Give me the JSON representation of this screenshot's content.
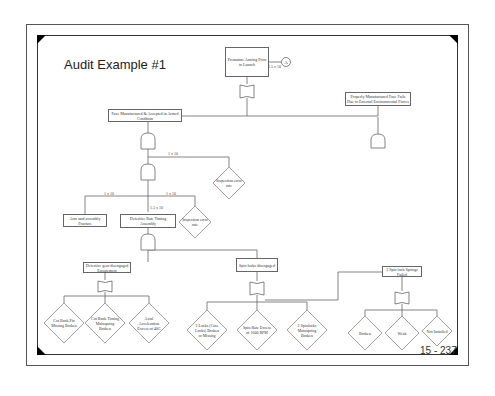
{
  "slide": {
    "title": "Audit Example #1",
    "page_number": "15 - 237"
  },
  "fault_tree": {
    "top_event": {
      "label": "Premature Arming Prior to Launch",
      "probability": "1.5 x 10",
      "transfer": "A"
    },
    "level1": [
      {
        "label": "Fuze Manufactured & Accepted in Armed Condition"
      },
      {
        "label": "Properly Manufactured Fuze Fails Due to External Environmental Forces"
      }
    ],
    "inspection_diamond_1": {
      "label": "Inspection error rate",
      "probability": "1 x 10"
    },
    "level2": [
      {
        "label": "Arm stud assembly Fracture",
        "probability": "1 x 10"
      },
      {
        "label": "Defective Rate Timing Assembly",
        "probability": "1.5 x 10"
      },
      {
        "label": "Inspection error rate",
        "probability": "1 x 10"
      }
    ],
    "level3": [
      {
        "label": "Defective gear disengaged Escapement"
      },
      {
        "label": "Spin locks disengaged"
      },
      {
        "label": "2 Spin lock Springs Failed"
      }
    ],
    "basic_events": [
      {
        "label": "Cot Bank Pin Missing Broken"
      },
      {
        "label": "Cot Bank Timing Mainspring Broken"
      },
      {
        "label": "Axial Acceleration Excess of 40G"
      },
      {
        "label": "2 Locks (Case Locks) Broken or Missing"
      },
      {
        "label": "Spin Rate Excess of 1600 RPM"
      },
      {
        "label": "2 Spinlocks Mainspring Broken"
      },
      {
        "label": "Broken"
      },
      {
        "label": "Weak"
      },
      {
        "label": "Not Installed"
      }
    ]
  }
}
